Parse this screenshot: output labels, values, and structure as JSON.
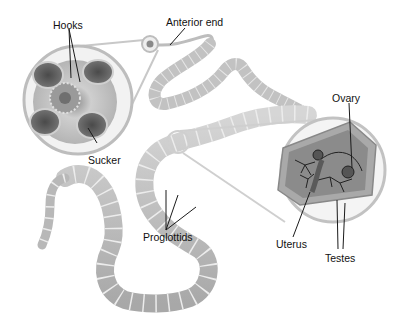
{
  "diagram": {
    "labels": {
      "hooks": "Hooks",
      "anterior_end": "Anterior end",
      "sucker": "Sucker",
      "ovary": "Ovary",
      "proglottids": "Proglottids",
      "uterus": "Uterus",
      "testes": "Testes"
    },
    "colors": {
      "body": "#c9c9c9",
      "body_dark": "#9a9a9a",
      "segment_line": "#e8e8e8",
      "magnifier_ring": "#bdbdbd",
      "organ_lines": "#2a2a2a",
      "label_text": "#111111"
    }
  }
}
